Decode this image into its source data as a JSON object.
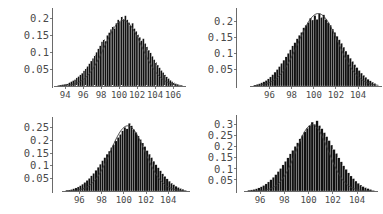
{
  "figure": {
    "background": "#ffffff",
    "bar_color": "#111111",
    "curve_color": "#3c3c3c",
    "axis_color": "#5a5a5a",
    "label_color": "#4a4a4a",
    "panel_count": 4,
    "layout": "2x2"
  },
  "chart_data": [
    {
      "type": "bar",
      "title": "",
      "subtitle": "",
      "xlabel": "",
      "ylabel": "",
      "panel_index": 0,
      "panel_position": "top-left",
      "grid": false,
      "legend": "none",
      "xlim": [
        93.2,
        107.0
      ],
      "ylim": [
        0,
        0.225
      ],
      "xticks": [
        94,
        96,
        98,
        100,
        102,
        104,
        106
      ],
      "xtick_labels": [
        "94",
        "96",
        "98",
        "100",
        "102",
        "104",
        "106"
      ],
      "yticks": [
        0.05,
        0.1,
        0.15,
        0.2
      ],
      "ytick_labels": [
        "0.05",
        "0.1",
        "0.15",
        "0.2"
      ],
      "bin_width": 0.2,
      "bin_centers": [
        93.3,
        93.5,
        93.7,
        93.9,
        94.1,
        94.3,
        94.5,
        94.7,
        94.9,
        95.1,
        95.3,
        95.5,
        95.7,
        95.9,
        96.1,
        96.3,
        96.5,
        96.7,
        96.9,
        97.1,
        97.3,
        97.5,
        97.7,
        97.9,
        98.1,
        98.3,
        98.5,
        98.7,
        98.9,
        99.1,
        99.3,
        99.5,
        99.7,
        99.9,
        100.1,
        100.3,
        100.5,
        100.7,
        100.9,
        101.1,
        101.3,
        101.5,
        101.7,
        101.9,
        102.1,
        102.3,
        102.5,
        102.7,
        102.9,
        103.1,
        103.3,
        103.5,
        103.7,
        103.9,
        104.1,
        104.3,
        104.5,
        104.7,
        104.9,
        105.1,
        105.3,
        105.5,
        105.7,
        105.9,
        106.1,
        106.3,
        106.5
      ],
      "values": [
        0.002,
        0.003,
        0.004,
        0.005,
        0.006,
        0.008,
        0.01,
        0.013,
        0.016,
        0.019,
        0.024,
        0.028,
        0.033,
        0.038,
        0.045,
        0.052,
        0.058,
        0.066,
        0.074,
        0.082,
        0.092,
        0.1,
        0.11,
        0.119,
        0.131,
        0.138,
        0.133,
        0.15,
        0.158,
        0.168,
        0.176,
        0.17,
        0.186,
        0.196,
        0.19,
        0.205,
        0.198,
        0.208,
        0.196,
        0.188,
        0.178,
        0.186,
        0.17,
        0.162,
        0.152,
        0.144,
        0.134,
        0.14,
        0.126,
        0.116,
        0.106,
        0.098,
        0.088,
        0.078,
        0.07,
        0.062,
        0.054,
        0.046,
        0.04,
        0.033,
        0.027,
        0.022,
        0.017,
        0.013,
        0.01,
        0.007,
        0.005
      ],
      "overlay_curve": {
        "name": "normal density",
        "mean": 100.45,
        "sigma": 2.06,
        "peak": 0.194
      }
    },
    {
      "type": "bar",
      "title": "",
      "subtitle": "",
      "xlabel": "",
      "ylabel": "",
      "panel_index": 1,
      "panel_position": "top-right",
      "grid": false,
      "legend": "none",
      "xlim": [
        94.6,
        105.8
      ],
      "ylim": [
        0,
        0.235
      ],
      "xticks": [
        96,
        98,
        100,
        102,
        104
      ],
      "xtick_labels": [
        "96",
        "98",
        "100",
        "102",
        "104"
      ],
      "yticks": [
        0.05,
        0.1,
        0.15,
        0.2
      ],
      "ytick_labels": [
        "0.05",
        "0.1",
        "0.15",
        "0.2"
      ],
      "bin_width": 0.2,
      "bin_centers": [
        94.7,
        94.9,
        95.1,
        95.3,
        95.5,
        95.7,
        95.9,
        96.1,
        96.3,
        96.5,
        96.7,
        96.9,
        97.1,
        97.3,
        97.5,
        97.7,
        97.9,
        98.1,
        98.3,
        98.5,
        98.7,
        98.9,
        99.1,
        99.3,
        99.5,
        99.7,
        99.9,
        100.1,
        100.3,
        100.5,
        100.7,
        100.9,
        101.1,
        101.3,
        101.5,
        101.7,
        101.9,
        102.1,
        102.3,
        102.5,
        102.7,
        102.9,
        103.1,
        103.3,
        103.5,
        103.7,
        103.9,
        104.1,
        104.3,
        104.5,
        104.7,
        104.9,
        105.1,
        105.3,
        105.5
      ],
      "values": [
        0.003,
        0.005,
        0.007,
        0.01,
        0.013,
        0.017,
        0.022,
        0.028,
        0.035,
        0.043,
        0.051,
        0.06,
        0.07,
        0.08,
        0.09,
        0.101,
        0.112,
        0.124,
        0.134,
        0.146,
        0.157,
        0.166,
        0.18,
        0.188,
        0.196,
        0.21,
        0.204,
        0.218,
        0.206,
        0.224,
        0.212,
        0.22,
        0.206,
        0.196,
        0.188,
        0.176,
        0.166,
        0.154,
        0.143,
        0.132,
        0.12,
        0.108,
        0.097,
        0.086,
        0.076,
        0.066,
        0.057,
        0.048,
        0.04,
        0.033,
        0.027,
        0.021,
        0.016,
        0.012,
        0.008
      ],
      "overlay_curve": {
        "name": "normal density",
        "mean": 100.4,
        "sigma": 1.78,
        "peak": 0.224
      }
    },
    {
      "type": "bar",
      "title": "",
      "subtitle": "",
      "xlabel": "",
      "ylabel": "",
      "panel_index": 2,
      "panel_position": "bottom-left",
      "grid": false,
      "legend": "none",
      "xlim": [
        94.8,
        105.6
      ],
      "ylim": [
        0,
        0.285
      ],
      "xticks": [
        96,
        98,
        100,
        102,
        104
      ],
      "xtick_labels": [
        "96",
        "98",
        "100",
        "102",
        "104"
      ],
      "yticks": [
        0.05,
        0.1,
        0.15,
        0.2,
        0.25
      ],
      "ytick_labels": [
        "0.05",
        "0.1",
        "0.15",
        "0.2",
        "0.25"
      ],
      "bin_width": 0.2,
      "bin_centers": [
        94.9,
        95.1,
        95.3,
        95.5,
        95.7,
        95.9,
        96.1,
        96.3,
        96.5,
        96.7,
        96.9,
        97.1,
        97.3,
        97.5,
        97.7,
        97.9,
        98.1,
        98.3,
        98.5,
        98.7,
        98.9,
        99.1,
        99.3,
        99.5,
        99.7,
        99.9,
        100.1,
        100.3,
        100.5,
        100.7,
        100.9,
        101.1,
        101.3,
        101.5,
        101.7,
        101.9,
        102.1,
        102.3,
        102.5,
        102.7,
        102.9,
        103.1,
        103.3,
        103.5,
        103.7,
        103.9,
        104.1,
        104.3,
        104.5,
        104.7,
        104.9,
        105.1,
        105.3
      ],
      "values": [
        0.003,
        0.004,
        0.006,
        0.009,
        0.012,
        0.016,
        0.021,
        0.027,
        0.034,
        0.042,
        0.05,
        0.06,
        0.07,
        0.082,
        0.094,
        0.106,
        0.12,
        0.132,
        0.146,
        0.158,
        0.172,
        0.184,
        0.198,
        0.212,
        0.224,
        0.238,
        0.252,
        0.246,
        0.268,
        0.258,
        0.244,
        0.232,
        0.218,
        0.204,
        0.19,
        0.176,
        0.16,
        0.146,
        0.132,
        0.118,
        0.104,
        0.092,
        0.08,
        0.068,
        0.058,
        0.048,
        0.039,
        0.031,
        0.025,
        0.019,
        0.014,
        0.01,
        0.007
      ],
      "overlay_curve": {
        "name": "normal density",
        "mean": 100.35,
        "sigma": 1.55,
        "peak": 0.258
      }
    },
    {
      "type": "bar",
      "title": "",
      "subtitle": "",
      "xlabel": "",
      "ylabel": "",
      "panel_index": 3,
      "panel_position": "bottom-right",
      "grid": false,
      "legend": "none",
      "xlim": [
        95.0,
        105.4
      ],
      "ylim": [
        0,
        0.335
      ],
      "xticks": [
        96,
        98,
        100,
        102,
        104
      ],
      "xtick_labels": [
        "96",
        "98",
        "100",
        "102",
        "104"
      ],
      "yticks": [
        0.05,
        0.1,
        0.15,
        0.2,
        0.25,
        0.3
      ],
      "ytick_labels": [
        "0.05",
        "0.1",
        "0.15",
        "0.2",
        "0.25",
        "0.3"
      ],
      "bin_width": 0.2,
      "bin_centers": [
        95.1,
        95.3,
        95.5,
        95.7,
        95.9,
        96.1,
        96.3,
        96.5,
        96.7,
        96.9,
        97.1,
        97.3,
        97.5,
        97.7,
        97.9,
        98.1,
        98.3,
        98.5,
        98.7,
        98.9,
        99.1,
        99.3,
        99.5,
        99.7,
        99.9,
        100.1,
        100.3,
        100.5,
        100.7,
        100.9,
        101.1,
        101.3,
        101.5,
        101.7,
        101.9,
        102.1,
        102.3,
        102.5,
        102.7,
        102.9,
        103.1,
        103.3,
        103.5,
        103.7,
        103.9,
        104.1,
        104.3,
        104.5,
        104.7,
        104.9,
        105.1
      ],
      "values": [
        0.003,
        0.005,
        0.007,
        0.01,
        0.014,
        0.019,
        0.025,
        0.032,
        0.041,
        0.051,
        0.062,
        0.074,
        0.088,
        0.102,
        0.118,
        0.134,
        0.15,
        0.168,
        0.184,
        0.202,
        0.218,
        0.236,
        0.252,
        0.268,
        0.284,
        0.296,
        0.312,
        0.302,
        0.318,
        0.296,
        0.282,
        0.264,
        0.246,
        0.228,
        0.208,
        0.188,
        0.17,
        0.15,
        0.132,
        0.114,
        0.098,
        0.082,
        0.068,
        0.056,
        0.045,
        0.035,
        0.027,
        0.02,
        0.015,
        0.011,
        0.007
      ],
      "overlay_curve": {
        "name": "normal density",
        "mean": 100.3,
        "sigma": 1.33,
        "peak": 0.3
      }
    }
  ]
}
